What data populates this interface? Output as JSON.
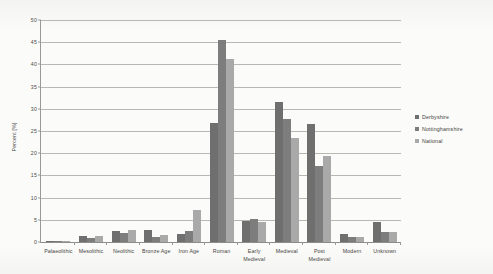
{
  "chart_data": {
    "type": "bar",
    "title": "",
    "xlabel": "",
    "ylabel": "Percent [%]",
    "ylim": [
      0,
      50
    ],
    "ytick_step": 5,
    "yticks": [
      "0",
      "5",
      "10",
      "15",
      "20",
      "25",
      "30",
      "35",
      "40",
      "45",
      "50"
    ],
    "grid": true,
    "legend_position": "right",
    "categories": [
      "Palaeolithic",
      "Mesolithic",
      "Neolithic",
      "Bronze Age",
      "Iron Age",
      "Roman",
      "Early\nMedieval",
      "Medieval",
      "Post\nMedieval",
      "Modern",
      "Unknown"
    ],
    "series": [
      {
        "name": "Derbyshire",
        "color": "#6f6f6f",
        "values": [
          0.3,
          1.3,
          2.5,
          2.7,
          1.7,
          26.9,
          4.7,
          31.6,
          26.6,
          1.9,
          4.6
        ]
      },
      {
        "name": "Nottinghamshire",
        "color": "#7d7d7d",
        "values": [
          0.1,
          0.9,
          2.0,
          1.1,
          2.4,
          45.5,
          5.1,
          27.6,
          17.1,
          1.2,
          2.3
        ]
      },
      {
        "name": "National",
        "color": "#a9a9a9",
        "values": [
          0.1,
          1.4,
          2.6,
          1.6,
          7.3,
          41.3,
          4.5,
          23.4,
          19.4,
          1.1,
          2.3
        ]
      }
    ]
  }
}
